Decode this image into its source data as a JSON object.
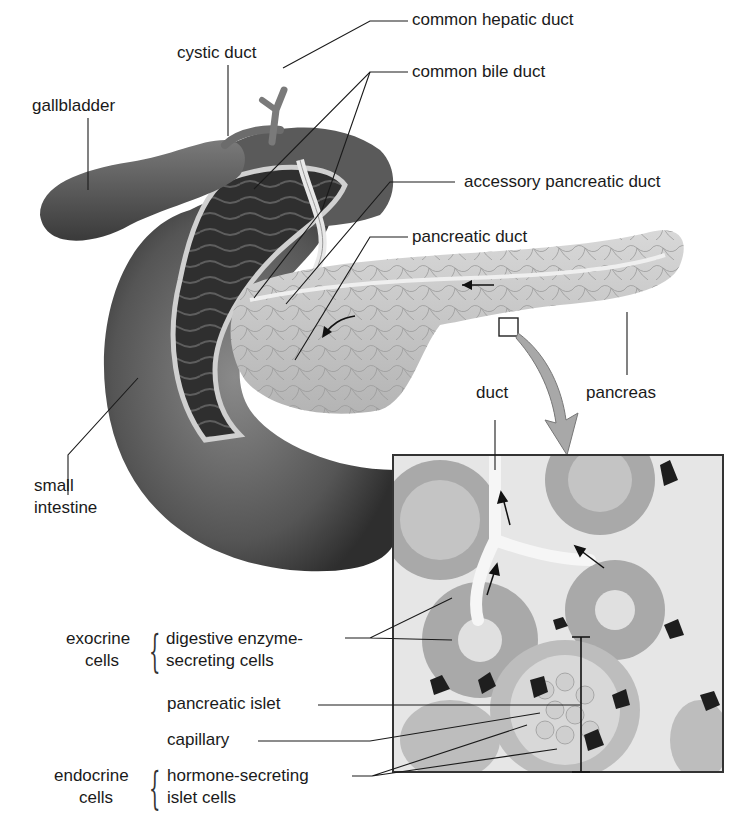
{
  "diagram": {
    "palette": {
      "background": "#ffffff",
      "ink": "#1a1a1a",
      "intestine_dark": "#3c3c3c",
      "intestine_mid": "#6e6e6e",
      "pancreas": "#cfcfcf",
      "inset_bg": "#e6e6e6",
      "capillary": "#1e1e1e",
      "arrow_fill": "#a8a8a8"
    },
    "labels": {
      "cystic_duct": "cystic duct",
      "common_hepatic_duct": "common hepatic duct",
      "gallbladder": "gallbladder",
      "common_bile_duct": "common bile duct",
      "accessory_pancreatic_duct": "accessory pancreatic duct",
      "pancreatic_duct": "pancreatic duct",
      "duct": "duct",
      "pancreas": "pancreas",
      "small_intestine_1": "small",
      "small_intestine_2": "intestine"
    },
    "inset_labels": {
      "exocrine_group_1": "exocrine",
      "exocrine_group_2": "cells",
      "digestive_1": "digestive enzyme-",
      "digestive_2": "secreting cells",
      "pancreatic_islet": "pancreatic islet",
      "capillary": "capillary",
      "endocrine_group_1": "endocrine",
      "endocrine_group_2": "cells",
      "hormone_1": "hormone-secreting",
      "hormone_2": "islet cells"
    },
    "brace_glyph": "{"
  }
}
